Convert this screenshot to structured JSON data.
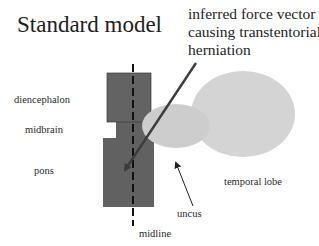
{
  "title": "Standard model",
  "annotation": {
    "line1": "inferred force vector",
    "line2": "causing transtentorial",
    "line3": "herniation"
  },
  "labels": {
    "diencephalon": "diencephalon",
    "midbrain": "midbrain",
    "pons": "pons",
    "temporal_lobe": "temporal lobe",
    "uncus": "uncus",
    "midline": "midline"
  },
  "colors": {
    "brainstem": "#616161",
    "temporal_lobe": "#d4d4d4",
    "uncus": "#cccccc",
    "force_arrow": "#3c3c3c",
    "midline": "#111111",
    "background": "#ffffff"
  }
}
